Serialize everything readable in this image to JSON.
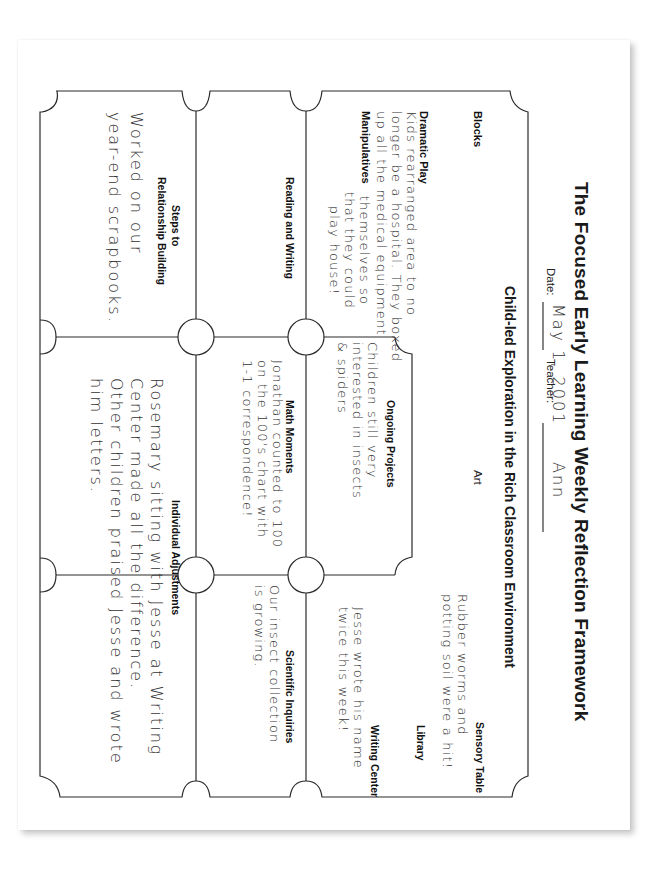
{
  "document": {
    "title": "The Focused Early Learning Weekly Reflection Framework",
    "subtitle": "Child-led Exploration in the Rich Classroom Environment",
    "date_label": "Date:",
    "date_value": "May 1, 2001",
    "teacher_label": "Teacher:",
    "teacher_value": "Ann"
  },
  "sections": {
    "blocks": {
      "heading": "Blocks",
      "note": ""
    },
    "art": {
      "heading": "Art",
      "note": ""
    },
    "sensory_table": {
      "heading": "Sensory Table",
      "note": "Rubber worms and\npotting soil were a hit!"
    },
    "dramatic_play": {
      "heading": "Dramatic Play",
      "note": "Kids rearranged area to no\nlonger be a hospital. They boxed\nup all the medical equipment"
    },
    "manipulatives": {
      "heading": "Manipulatives",
      "note": "themselves so\nthat they could\nplay house!"
    },
    "library": {
      "heading": "Library",
      "note": ""
    },
    "writing_center": {
      "heading": "Writing Center",
      "note": "Jesse wrote his name\ntwice this week!"
    },
    "reading_writing": {
      "heading": "Reading and Writing",
      "note": ""
    },
    "ongoing_projects": {
      "heading": "Ongoing Projects",
      "note": "Children still very\ninterested in insects\n& spiders"
    },
    "math_moments": {
      "heading": "Math Moments",
      "note": "Jonathan counted to 100\non the 100's chart with\n1-1 correspondence!"
    },
    "scientific_inquiries": {
      "heading": "Scientific Inquiries",
      "note": "Our insect collection\nis growing."
    },
    "relationship_building": {
      "heading_line1": "Steps to",
      "heading_line2": "Relationship Building",
      "note": "Worked on our\nyear-end scrapbooks."
    },
    "individual_adjustments": {
      "heading": "Individual Adjustments",
      "note": "Rosemary sitting with Jesse at Writing\nCenter made all the difference.\nOther children praised Jesse and wrote\nhim letters."
    }
  },
  "colors": {
    "ink": "#222222",
    "paper": "#ffffff",
    "shadow": "#c8c8c8"
  }
}
